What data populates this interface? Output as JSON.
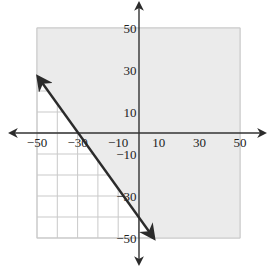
{
  "chart_data": {
    "type": "line",
    "title": "",
    "xlabel": "",
    "ylabel": "",
    "xlim": [
      -50,
      50
    ],
    "ylim": [
      -50,
      50
    ],
    "grid": true,
    "grid_step": 10,
    "x_tick_labels": [
      "-50",
      "-30",
      "-10",
      "10",
      "30",
      "50"
    ],
    "x_tick_values": [
      -50,
      -30,
      -10,
      10,
      30,
      50
    ],
    "y_tick_labels": [
      "50",
      "30",
      "10",
      "-10",
      "-30",
      "-50"
    ],
    "y_tick_values": [
      50,
      30,
      10,
      -10,
      -30,
      -50
    ],
    "boundary_line": {
      "equation": "y = -4/3 x - 40",
      "slope": -1.3333,
      "intercept": -40,
      "x_intercept": -30,
      "style": "solid",
      "arrows": "both",
      "points": [
        [
          -50,
          26.7
        ],
        [
          7.5,
          -50
        ]
      ]
    },
    "shaded_region": {
      "description": "half-plane above the line",
      "inequality": "y >= -4/3 x - 40",
      "color": "#ebebeb"
    },
    "colors": {
      "axis": "#333333",
      "line": "#2b2b2b",
      "grid": "#c9c9c9",
      "shade": "#ebebeb"
    }
  }
}
